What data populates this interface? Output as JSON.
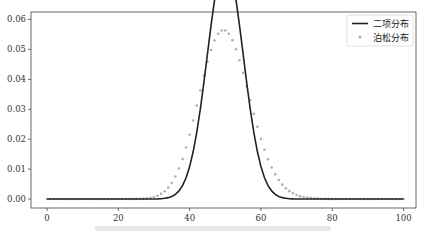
{
  "chart_data": {
    "type": "line",
    "title": "",
    "xlabel": "",
    "ylabel": "",
    "xlim": [
      -4.5,
      103.5
    ],
    "ylim": [
      -0.003,
      0.0625
    ],
    "x_ticks": [
      0,
      20,
      40,
      60,
      80,
      100
    ],
    "x_tick_labels": [
      "0",
      "20",
      "40",
      "60",
      "80",
      "100"
    ],
    "y_ticks": [
      0.0,
      0.01,
      0.02,
      0.03,
      0.04,
      0.05,
      0.06
    ],
    "y_tick_labels": [
      "0.00",
      "0.01",
      "0.02",
      "0.03",
      "0.04",
      "0.05",
      "0.06"
    ],
    "grid": false,
    "legend_position": "upper right",
    "series": [
      {
        "name": "二项分布",
        "style": "line",
        "color": "#222222",
        "n": 100,
        "p": 0.5,
        "x_range": [
          0,
          100
        ],
        "peak": {
          "x": 50,
          "y": 0.0796
        }
      },
      {
        "name": "泊松分布",
        "style": "scatter",
        "color": "#b0b0b0",
        "lambda": 50,
        "x_range": [
          0,
          100
        ],
        "peak": {
          "x": 50,
          "y": 0.0563
        }
      }
    ]
  },
  "legend": {
    "items": [
      {
        "label": "二项分布",
        "kind": "line",
        "color": "#222222"
      },
      {
        "label": "泊松分布",
        "kind": "marker",
        "color": "#b0b0b0"
      }
    ]
  }
}
